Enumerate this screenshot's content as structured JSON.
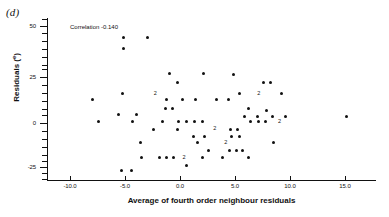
{
  "panel": {
    "label": "(d)"
  },
  "annotation": {
    "text": "Correlation  -0.140",
    "x_px": 70,
    "y_px": 24
  },
  "axes": {
    "xlabel": "Average of fourth order neighbour residuals",
    "ylabel_main": "Residuals (",
    "ylabel_sup": "e",
    "ylabel_close": ")",
    "xticks": [
      {
        "label": "-10.0",
        "value": -10.0,
        "px": 70
      },
      {
        "label": "-5.0",
        "value": -5.0,
        "px": 125
      },
      {
        "label": "0.0",
        "value": 0.0,
        "px": 180
      },
      {
        "label": "5.0",
        "value": 5.0,
        "px": 235
      },
      {
        "label": "10.0",
        "value": 10.0,
        "px": 290
      },
      {
        "label": "15.0",
        "value": 15.0,
        "px": 345
      }
    ],
    "yticks_major": [
      {
        "label": "50",
        "value": 50,
        "px": 26
      },
      {
        "label": "25",
        "value": 25,
        "px": 77
      },
      {
        "label": "0",
        "value": 0,
        "px": 123
      },
      {
        "label": "-25",
        "value": -25,
        "px": 167
      }
    ],
    "yticks_minor_px": [
      19,
      33,
      41,
      49,
      57,
      65,
      69,
      85,
      93,
      101,
      109,
      115,
      131,
      139,
      147,
      155,
      161,
      173,
      179
    ],
    "xlim": [
      -12.5,
      17.5
    ],
    "ylim": [
      -32,
      53
    ]
  },
  "chart_data": {
    "type": "scatter",
    "title": "(d)",
    "xlabel": "Average of fourth order neighbour residuals",
    "ylabel": "Residuals (e)",
    "xlim": [
      -12.5,
      17.5
    ],
    "ylim": [
      -32,
      53
    ],
    "grid": false,
    "legend": null,
    "annotations": [
      {
        "text": "Correlation  -0.140",
        "x": -9.5,
        "y": 47
      }
    ],
    "correlation": -0.14,
    "note": "Numeric labels '2' mark coincident pairs of points",
    "points": [
      {
        "x": -5.1,
        "y": 44,
        "n": 1
      },
      {
        "x": -5.1,
        "y": 38,
        "n": 1
      },
      {
        "x": -3.0,
        "y": 44,
        "n": 1
      },
      {
        "x": -1.0,
        "y": 25,
        "n": 1
      },
      {
        "x": 2.1,
        "y": 25,
        "n": 1
      },
      {
        "x": 4.9,
        "y": 24,
        "n": 1
      },
      {
        "x": 7.6,
        "y": 20,
        "n": 1
      },
      {
        "x": 8.2,
        "y": 20,
        "n": 1
      },
      {
        "x": -0.2,
        "y": 20,
        "n": 1
      },
      {
        "x": -5.2,
        "y": 14,
        "n": 1
      },
      {
        "x": -2.2,
        "y": 14,
        "n": 2
      },
      {
        "x": 5.4,
        "y": 14,
        "n": 1
      },
      {
        "x": 7.2,
        "y": 14,
        "n": 2
      },
      {
        "x": 9.2,
        "y": 14,
        "n": 1
      },
      {
        "x": -8.0,
        "y": 11,
        "n": 1
      },
      {
        "x": -1.2,
        "y": 11,
        "n": 1
      },
      {
        "x": 0.2,
        "y": 11,
        "n": 1
      },
      {
        "x": 1.4,
        "y": 11,
        "n": 1
      },
      {
        "x": 3.3,
        "y": 11,
        "n": 1
      },
      {
        "x": 4.4,
        "y": 11,
        "n": 1
      },
      {
        "x": -1.3,
        "y": 6,
        "n": 1
      },
      {
        "x": -0.7,
        "y": 6,
        "n": 1
      },
      {
        "x": 6.2,
        "y": 6,
        "n": 1
      },
      {
        "x": -5.6,
        "y": 3,
        "n": 1
      },
      {
        "x": -4.0,
        "y": 3,
        "n": 1
      },
      {
        "x": 7.9,
        "y": 5,
        "n": 1
      },
      {
        "x": 5.9,
        "y": 2,
        "n": 1
      },
      {
        "x": 7.0,
        "y": 2,
        "n": 1
      },
      {
        "x": 8.4,
        "y": 2,
        "n": 1
      },
      {
        "x": 9.6,
        "y": 2,
        "n": 1
      },
      {
        "x": 15.1,
        "y": 2,
        "n": 1
      },
      {
        "x": -1.6,
        "y": -1,
        "n": 1
      },
      {
        "x": -0.1,
        "y": -1,
        "n": 1
      },
      {
        "x": 0.6,
        "y": -1,
        "n": 1
      },
      {
        "x": 1.3,
        "y": -1,
        "n": 1
      },
      {
        "x": 2.0,
        "y": -1,
        "n": 1
      },
      {
        "x": -7.4,
        "y": -1,
        "n": 1
      },
      {
        "x": -4.3,
        "y": -1,
        "n": 1
      },
      {
        "x": 6.4,
        "y": -1,
        "n": 1
      },
      {
        "x": 7.1,
        "y": -1,
        "n": 1
      },
      {
        "x": 7.8,
        "y": -1,
        "n": 1
      },
      {
        "x": 9.1,
        "y": -1,
        "n": 2
      },
      {
        "x": -2.4,
        "y": -5,
        "n": 1
      },
      {
        "x": -0.2,
        "y": -5,
        "n": 1
      },
      {
        "x": 3.2,
        "y": -5,
        "n": 2
      },
      {
        "x": 4.6,
        "y": -5,
        "n": 1
      },
      {
        "x": 5.2,
        "y": -5,
        "n": 1
      },
      {
        "x": 1.2,
        "y": -9,
        "n": 1
      },
      {
        "x": 2.2,
        "y": -9,
        "n": 1
      },
      {
        "x": 4.7,
        "y": -9,
        "n": 1
      },
      {
        "x": 5.4,
        "y": -9,
        "n": 1
      },
      {
        "x": -3.6,
        "y": -12,
        "n": 1
      },
      {
        "x": 1.6,
        "y": -12,
        "n": 1
      },
      {
        "x": 4.2,
        "y": -12,
        "n": 2
      },
      {
        "x": 8.5,
        "y": -12,
        "n": 1
      },
      {
        "x": 2.6,
        "y": -16,
        "n": 1
      },
      {
        "x": 4.5,
        "y": -16,
        "n": 1
      },
      {
        "x": 5.1,
        "y": -16,
        "n": 1
      },
      {
        "x": 5.7,
        "y": -16,
        "n": 1
      },
      {
        "x": -3.5,
        "y": -20,
        "n": 1
      },
      {
        "x": -1.9,
        "y": -20,
        "n": 1
      },
      {
        "x": -1.2,
        "y": -20,
        "n": 1
      },
      {
        "x": -0.6,
        "y": -20,
        "n": 1
      },
      {
        "x": 0.4,
        "y": -20,
        "n": 2
      },
      {
        "x": 2.0,
        "y": -20,
        "n": 1
      },
      {
        "x": 3.9,
        "y": -20,
        "n": 1
      },
      {
        "x": 6.2,
        "y": -20,
        "n": 1
      },
      {
        "x": 0.6,
        "y": -24,
        "n": 1
      },
      {
        "x": -5.3,
        "y": -27,
        "n": 1
      },
      {
        "x": -4.4,
        "y": -27,
        "n": 1
      }
    ]
  }
}
